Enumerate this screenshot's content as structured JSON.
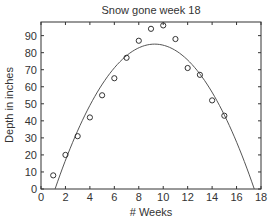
{
  "chart_data": {
    "type": "scatter",
    "title": "Snow gone week 18",
    "xlabel": "# Weeks",
    "ylabel": "Depth in inches",
    "xlim": [
      0,
      18
    ],
    "ylim": [
      0,
      98
    ],
    "x_ticks": [
      0,
      2,
      4,
      6,
      8,
      10,
      12,
      14,
      16,
      18
    ],
    "y_ticks": [
      0,
      10,
      20,
      30,
      40,
      50,
      60,
      70,
      80,
      90
    ],
    "grid": false,
    "legend": null,
    "series": [
      {
        "name": "Observed depth",
        "type": "scatter",
        "marker": "circle-open",
        "x": [
          1,
          2,
          3,
          4,
          5,
          6,
          7,
          8,
          9,
          10,
          11,
          12,
          13,
          14,
          15
        ],
        "y": [
          8,
          20,
          31,
          42,
          55,
          65,
          77,
          87,
          94,
          96,
          88,
          71,
          67,
          52,
          43
        ]
      },
      {
        "name": "Quadratic fit",
        "type": "line",
        "description": "Downward parabola fitted to the data, zero near week 1.15 and week 17.45, peak about 85 near week 9.3",
        "coefficients": {
          "a": -1.28,
          "root1": 1.15,
          "root2": 17.45
        },
        "x_range": [
          1.15,
          17.45
        ]
      }
    ]
  },
  "colors": {
    "axis": "#333333",
    "marker": "#333333",
    "curve": "#555555",
    "background": "#ffffff"
  }
}
